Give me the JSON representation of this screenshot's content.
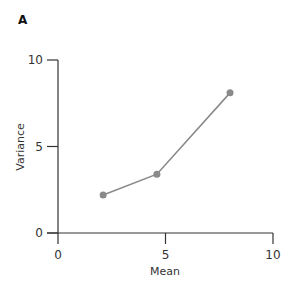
{
  "panel_label": "A",
  "chart_data": {
    "type": "line",
    "title": "",
    "xlabel": "Mean",
    "ylabel": "Variance",
    "xlim": [
      0,
      10
    ],
    "ylim": [
      0,
      10
    ],
    "xticks": [
      0,
      5,
      10
    ],
    "yticks": [
      0,
      5,
      10
    ],
    "xtick_labels": [
      "0",
      "5",
      "10"
    ],
    "ytick_labels": [
      "0",
      "5",
      "10"
    ],
    "grid": false,
    "legend": null,
    "series": [
      {
        "name": "mean-variance",
        "x": [
          2.1,
          4.6,
          8.0
        ],
        "y": [
          2.2,
          3.4,
          8.1
        ],
        "color": "#8a8a8a",
        "marker": "circle"
      }
    ]
  }
}
